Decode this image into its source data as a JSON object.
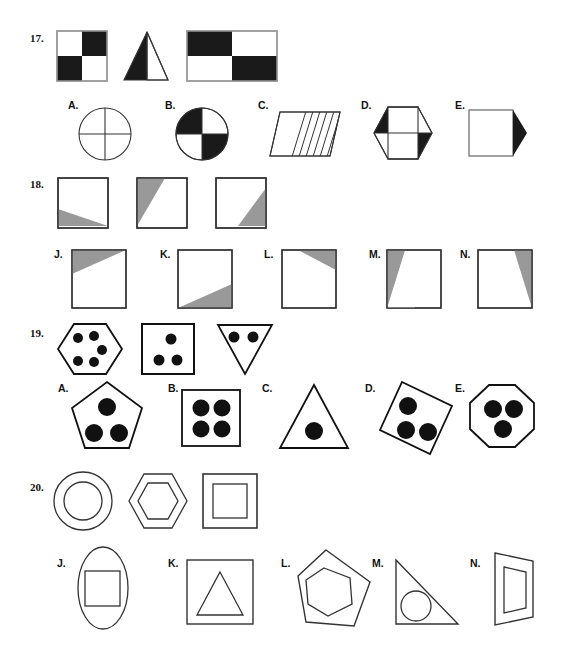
{
  "document": {
    "type": "figure-matrix-test-worksheet",
    "description": "Non-verbal reasoning worksheet page with four numbered questions, each showing a row of sample figures above a row of lettered answer choices.",
    "colors": {
      "ink": "#111111",
      "black_fill": "#1a1a1a",
      "gray_fill": "#999999",
      "white_fill": "#ffffff",
      "page_background": "#ffffff"
    }
  },
  "questions": [
    {
      "number": "17.",
      "prompt_figures": [
        {
          "name": "checkered-square",
          "desc": "square divided into 4 quadrants, top-left white, top-right black, bottom-left black, bottom-right white"
        },
        {
          "name": "half-shaded-triangle",
          "desc": "triangle with left half black and right half white"
        },
        {
          "name": "checkered-rectangle",
          "desc": "rectangle in 4 cells, top-left black, top-right white, bottom-left white, bottom-right black"
        }
      ],
      "option_labels": [
        "A.",
        "B.",
        "C.",
        "D.",
        "E."
      ],
      "options": [
        {
          "label": "A.",
          "name": "circle-quartered-white",
          "desc": "circle divided into four white quadrants by a cross"
        },
        {
          "label": "B.",
          "name": "circle-checkered",
          "desc": "circle with top-left and bottom-right quadrants black"
        },
        {
          "label": "C.",
          "name": "parallelogram-hatched",
          "desc": "parallelogram with diagonal hatch lines on its right portion"
        },
        {
          "label": "D.",
          "name": "hexagon-with-rectangle",
          "desc": "hexagon containing a rectangle, with black triangles top-left and bottom-right"
        },
        {
          "label": "E.",
          "name": "square-with-black-arrow",
          "desc": "white square with a black triangle pointing right on its right edge"
        }
      ]
    },
    {
      "number": "18.",
      "prompt_figures": [
        {
          "name": "square-gray-bottom-left",
          "desc": "square with gray triangle occupying the bottom-left wedge"
        },
        {
          "name": "square-gray-top-left",
          "desc": "square with gray triangle occupying the top-left wedge"
        },
        {
          "name": "square-gray-bottom-right",
          "desc": "square with gray triangle occupying the bottom-right wedge"
        }
      ],
      "option_labels": [
        "J.",
        "K.",
        "L.",
        "M.",
        "N."
      ],
      "options": [
        {
          "label": "J.",
          "name": "square-gray-top-wedge",
          "desc": "square with a wide gray wedge across the top"
        },
        {
          "label": "K.",
          "name": "square-gray-bottom-wedge",
          "desc": "square with a wide gray wedge across the bottom"
        },
        {
          "label": "L.",
          "name": "square-gray-thin-top-right",
          "desc": "square with a narrow gray wedge at the top-right"
        },
        {
          "label": "M.",
          "name": "square-gray-left-wedge",
          "desc": "square with a gray wedge down the left side"
        },
        {
          "label": "N.",
          "name": "square-gray-right-wedge",
          "desc": "square with a gray wedge down the right side"
        }
      ]
    },
    {
      "number": "19.",
      "prompt_figures": [
        {
          "name": "hexagon-five-dots",
          "desc": "hexagon containing five black dots",
          "dots": 5
        },
        {
          "name": "square-three-dots",
          "desc": "square containing three black dots",
          "dots": 3
        },
        {
          "name": "inverted-triangle-two-dots",
          "desc": "downward pointing triangle containing two black dots",
          "dots": 2
        }
      ],
      "option_labels": [
        "A.",
        "B.",
        "C.",
        "D.",
        "E."
      ],
      "options": [
        {
          "label": "A.",
          "name": "pentagon-three-dots",
          "desc": "pentagon containing three black dots",
          "dots": 3
        },
        {
          "label": "B.",
          "name": "square-four-dots",
          "desc": "square containing four black dots",
          "dots": 4
        },
        {
          "label": "C.",
          "name": "triangle-one-dot",
          "desc": "triangle containing one black dot",
          "dots": 1
        },
        {
          "label": "D.",
          "name": "diamond-three-dots",
          "desc": "tilted square containing three black dots",
          "dots": 3
        },
        {
          "label": "E.",
          "name": "octagon-three-dots",
          "desc": "octagon containing three black dots",
          "dots": 3
        }
      ]
    },
    {
      "number": "20.",
      "prompt_figures": [
        {
          "name": "circle-in-circle",
          "desc": "circle with a smaller concentric circle inside"
        },
        {
          "name": "hexagon-in-hexagon",
          "desc": "hexagon with a smaller hexagon inside"
        },
        {
          "name": "square-in-square",
          "desc": "square with a smaller square inside"
        }
      ],
      "option_labels": [
        "J.",
        "K.",
        "L.",
        "M.",
        "N."
      ],
      "options": [
        {
          "label": "J.",
          "name": "ellipse-with-square",
          "desc": "vertical ellipse containing a square"
        },
        {
          "label": "K.",
          "name": "square-with-triangle",
          "desc": "square containing a triangle"
        },
        {
          "label": "L.",
          "name": "pentagon-with-hexagon",
          "desc": "pentagon containing a hexagon"
        },
        {
          "label": "M.",
          "name": "triangle-with-circle",
          "desc": "right triangle containing a circle"
        },
        {
          "label": "N.",
          "name": "parallelogram-with-rectangle",
          "desc": "slanted quadrilateral containing a smaller slanted rectangle"
        }
      ]
    }
  ]
}
